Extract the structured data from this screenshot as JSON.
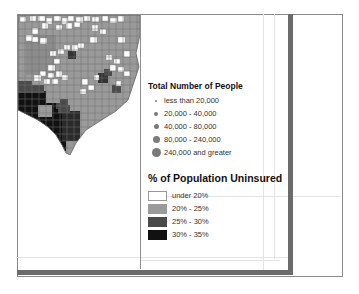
{
  "map": {
    "region": "Texas counties (partial)",
    "fill_colors": {
      "under_20": "#ffffff",
      "p20_25": "#9a9a9a",
      "p25_30": "#4a4a4a",
      "p30_35": "#111111"
    }
  },
  "legend_people": {
    "title": "Total Number of People",
    "items": [
      {
        "label": "less than 20,000",
        "size": 2
      },
      {
        "label": "20,000 - 40,000",
        "size": 4
      },
      {
        "label": "40,000 - 80,000",
        "size": 6
      },
      {
        "label": "80,000 - 240,000",
        "size": 8
      },
      {
        "label": "240,000 and greater",
        "size": 10
      }
    ],
    "dot_color": "#7a7a7a"
  },
  "legend_uninsured": {
    "title": "% of Population Uninsured",
    "items": [
      {
        "label": "under 20%",
        "color": "#ffffff"
      },
      {
        "label": "20% - 25%",
        "color": "#9a9a9a"
      },
      {
        "label": "25% - 30%",
        "color": "#4a4a4a"
      },
      {
        "label": "30% - 35%",
        "color": "#111111"
      }
    ]
  }
}
